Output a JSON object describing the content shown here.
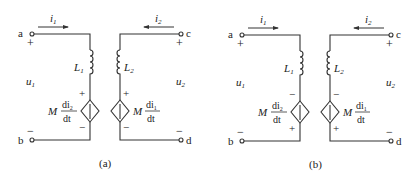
{
  "figures": [
    {
      "caption": "(a)",
      "terminals": {
        "a": "a",
        "b": "b",
        "c": "c",
        "d": "d"
      },
      "currents": {
        "left": "i",
        "left_sub": "1",
        "right": "i",
        "right_sub": "2"
      },
      "voltages": {
        "left": "u",
        "left_sub": "1",
        "right": "u",
        "right_sub": "2"
      },
      "inductors": {
        "left": "L",
        "left_sub": "1",
        "right": "L",
        "right_sub": "2"
      },
      "sources": {
        "left": {
          "coef": "M",
          "num": "di",
          "num_sub": "2",
          "den": "dt",
          "top_sign": "+",
          "bottom_sign": "−"
        },
        "right": {
          "coef": "M",
          "num": "di",
          "num_sub": "1",
          "den": "dt",
          "top_sign": "+",
          "bottom_sign": "−"
        }
      },
      "port_signs": {
        "a": "+",
        "b": "−",
        "c": "+",
        "d": "−"
      }
    },
    {
      "caption": "(b)",
      "terminals": {
        "a": "a",
        "b": "b",
        "c": "c",
        "d": "d"
      },
      "currents": {
        "left": "i",
        "left_sub": "1",
        "right": "i",
        "right_sub": "2"
      },
      "voltages": {
        "left": "u",
        "left_sub": "1",
        "right": "u",
        "right_sub": "2"
      },
      "inductors": {
        "left": "L",
        "left_sub": "1",
        "right": "L",
        "right_sub": "2"
      },
      "sources": {
        "left": {
          "coef": "M",
          "num": "di",
          "num_sub": "2",
          "den": "dt",
          "top_sign": "−",
          "bottom_sign": "+"
        },
        "right": {
          "coef": "M",
          "num": "di",
          "num_sub": "1",
          "den": "dt",
          "top_sign": "−",
          "bottom_sign": "+"
        }
      },
      "port_signs": {
        "a": "+",
        "b": "−",
        "c": "+",
        "d": "−"
      }
    }
  ]
}
